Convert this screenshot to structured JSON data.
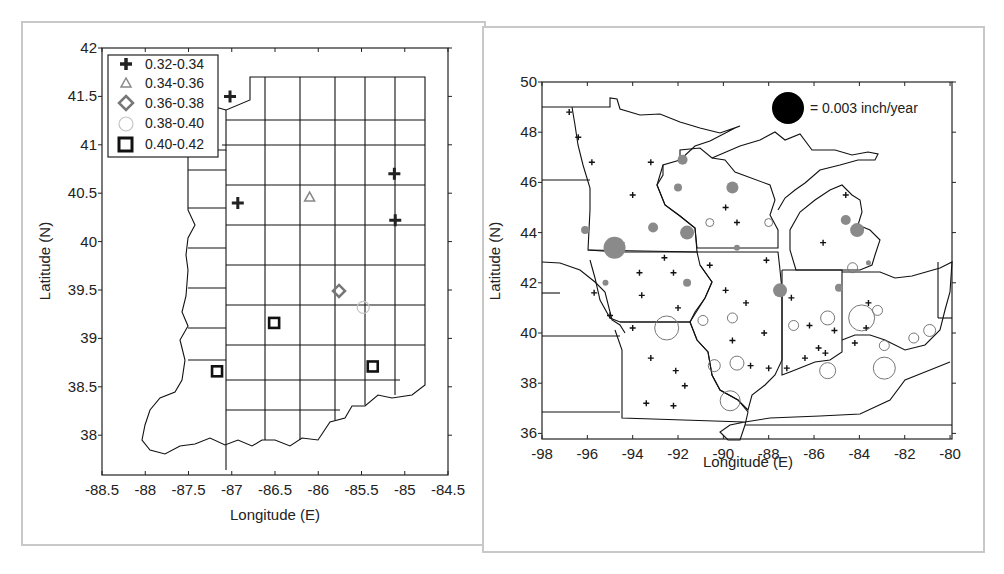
{
  "chart_data": [
    {
      "type": "scatter",
      "title": "",
      "xlabel": "Longitude (E)",
      "ylabel": "Latitude (N)",
      "xlim": [
        -88.5,
        -84.5
      ],
      "ylim": [
        37.6,
        42
      ],
      "xticks": [
        "-88.5",
        "-88",
        "-87.5",
        "-87",
        "-86.5",
        "-86",
        "-85.5",
        "-85",
        "-84.5"
      ],
      "yticks": [
        "42",
        "41.5",
        "41",
        "40.5",
        "40",
        "39.5",
        "39",
        "38.5",
        "38"
      ],
      "grid": false,
      "legend_position": "upper-left",
      "legend": [
        {
          "label": "0.32-0.34",
          "symbol": "plus",
          "color": "#222222"
        },
        {
          "label": "0.34-0.36",
          "symbol": "triangle",
          "color": "#888888"
        },
        {
          "label": "0.36-0.38",
          "symbol": "diamond",
          "color": "#777777"
        },
        {
          "label": "0.38-0.40",
          "symbol": "circle",
          "color": "#bbbbbb"
        },
        {
          "label": "0.40-0.42",
          "symbol": "square",
          "color": "#111111"
        }
      ],
      "points": [
        {
          "lon": -87.02,
          "lat": 41.5,
          "class": "0.32-0.34"
        },
        {
          "lon": -86.93,
          "lat": 40.4,
          "class": "0.32-0.34"
        },
        {
          "lon": -85.12,
          "lat": 40.7,
          "class": "0.32-0.34"
        },
        {
          "lon": -85.11,
          "lat": 40.22,
          "class": "0.32-0.34"
        },
        {
          "lon": -86.1,
          "lat": 40.46,
          "class": "0.34-0.36"
        },
        {
          "lon": -85.76,
          "lat": 39.49,
          "class": "0.36-0.38"
        },
        {
          "lon": -85.48,
          "lat": 39.32,
          "class": "0.38-0.40"
        },
        {
          "lon": -86.51,
          "lat": 39.16,
          "class": "0.40-0.42"
        },
        {
          "lon": -87.17,
          "lat": 38.66,
          "class": "0.40-0.42"
        },
        {
          "lon": -85.37,
          "lat": 38.71,
          "class": "0.40-0.42"
        }
      ]
    },
    {
      "type": "scatter",
      "title": "",
      "xlabel": "Longitude (E)",
      "ylabel": "Latitude (N)",
      "xlim": [
        -98,
        -80
      ],
      "ylim": [
        35.7,
        50
      ],
      "xticks": [
        "-98",
        "-96",
        "-94",
        "-92",
        "-90",
        "-88",
        "-86",
        "-84",
        "-82",
        "-80"
      ],
      "yticks": [
        "50",
        "48",
        "46",
        "44",
        "42",
        "40",
        "38",
        "36"
      ],
      "grid": false,
      "legend": [
        {
          "label": "= 0.003 inch/year",
          "symbol": "filled-circle",
          "color": "#000000"
        }
      ],
      "size_reference": {
        "value": 0.003,
        "unit": "inch/year",
        "radius_px": 16
      },
      "colors": {
        "positive": "#8a8a8a",
        "negative": "#7a7a7a",
        "small": "#111111"
      },
      "points": [
        {
          "lon": -96.8,
          "lat": 48.8,
          "kind": "plus"
        },
        {
          "lon": -96.4,
          "lat": 47.8,
          "kind": "plus"
        },
        {
          "lon": -95.8,
          "lat": 46.8,
          "kind": "plus"
        },
        {
          "lon": -93.2,
          "lat": 46.8,
          "kind": "plus"
        },
        {
          "lon": -94.0,
          "lat": 45.5,
          "kind": "plus"
        },
        {
          "lon": -89.9,
          "lat": 45.0,
          "kind": "plus"
        },
        {
          "lon": -89.4,
          "lat": 44.4,
          "kind": "plus"
        },
        {
          "lon": -94.5,
          "lat": 43.6,
          "kind": "plus"
        },
        {
          "lon": -92.6,
          "lat": 43.0,
          "kind": "plus"
        },
        {
          "lon": -90.6,
          "lat": 42.7,
          "kind": "plus"
        },
        {
          "lon": -88.1,
          "lat": 42.9,
          "kind": "plus"
        },
        {
          "lon": -93.7,
          "lat": 42.4,
          "kind": "plus"
        },
        {
          "lon": -92.2,
          "lat": 42.4,
          "kind": "plus"
        },
        {
          "lon": -95.7,
          "lat": 41.6,
          "kind": "plus"
        },
        {
          "lon": -93.6,
          "lat": 41.5,
          "kind": "plus"
        },
        {
          "lon": -92.0,
          "lat": 41.0,
          "kind": "plus"
        },
        {
          "lon": -89.9,
          "lat": 41.7,
          "kind": "plus"
        },
        {
          "lon": -89.0,
          "lat": 41.2,
          "kind": "plus"
        },
        {
          "lon": -95.0,
          "lat": 40.7,
          "kind": "plus"
        },
        {
          "lon": -94.0,
          "lat": 40.2,
          "kind": "plus"
        },
        {
          "lon": -89.6,
          "lat": 39.7,
          "kind": "plus"
        },
        {
          "lon": -88.2,
          "lat": 40.0,
          "kind": "plus"
        },
        {
          "lon": -93.2,
          "lat": 39.0,
          "kind": "plus"
        },
        {
          "lon": -92.1,
          "lat": 38.5,
          "kind": "plus"
        },
        {
          "lon": -91.7,
          "lat": 37.9,
          "kind": "plus"
        },
        {
          "lon": -93.4,
          "lat": 37.2,
          "kind": "plus"
        },
        {
          "lon": -92.2,
          "lat": 37.1,
          "kind": "plus"
        },
        {
          "lon": -88.8,
          "lat": 38.7,
          "kind": "plus"
        },
        {
          "lon": -88.0,
          "lat": 38.6,
          "kind": "plus"
        },
        {
          "lon": -87.0,
          "lat": 41.4,
          "kind": "plus"
        },
        {
          "lon": -86.2,
          "lat": 40.3,
          "kind": "plus"
        },
        {
          "lon": -85.8,
          "lat": 39.4,
          "kind": "plus"
        },
        {
          "lon": -85.5,
          "lat": 39.2,
          "kind": "plus"
        },
        {
          "lon": -86.4,
          "lat": 39.0,
          "kind": "plus"
        },
        {
          "lon": -87.2,
          "lat": 38.6,
          "kind": "plus"
        },
        {
          "lon": -85.1,
          "lat": 40.1,
          "kind": "plus"
        },
        {
          "lon": -83.6,
          "lat": 41.2,
          "kind": "plus"
        },
        {
          "lon": -83.7,
          "lat": 40.2,
          "kind": "plus"
        },
        {
          "lon": -84.2,
          "lat": 39.6,
          "kind": "plus"
        },
        {
          "lon": -85.6,
          "lat": 43.6,
          "kind": "plus"
        },
        {
          "lon": -84.6,
          "lat": 45.5,
          "kind": "plus"
        },
        {
          "lon": -91.8,
          "lat": 46.9,
          "kind": "filled",
          "r": 5
        },
        {
          "lon": -92.0,
          "lat": 45.8,
          "kind": "filled",
          "r": 4
        },
        {
          "lon": -89.6,
          "lat": 45.8,
          "kind": "filled",
          "r": 6
        },
        {
          "lon": -96.1,
          "lat": 44.1,
          "kind": "filled",
          "r": 4
        },
        {
          "lon": -93.1,
          "lat": 44.2,
          "kind": "filled",
          "r": 5
        },
        {
          "lon": -91.6,
          "lat": 44.0,
          "kind": "filled",
          "r": 7
        },
        {
          "lon": -94.8,
          "lat": 43.4,
          "kind": "filled",
          "r": 11
        },
        {
          "lon": -89.4,
          "lat": 43.4,
          "kind": "filled",
          "r": 3
        },
        {
          "lon": -95.2,
          "lat": 42.0,
          "kind": "filled",
          "r": 3
        },
        {
          "lon": -91.6,
          "lat": 42.0,
          "kind": "filled",
          "r": 4
        },
        {
          "lon": -87.5,
          "lat": 41.7,
          "kind": "filled",
          "r": 7
        },
        {
          "lon": -84.6,
          "lat": 44.5,
          "kind": "filled",
          "r": 5
        },
        {
          "lon": -84.1,
          "lat": 44.1,
          "kind": "filled",
          "r": 7
        },
        {
          "lon": -83.6,
          "lat": 42.8,
          "kind": "filled",
          "r": 2.5
        },
        {
          "lon": -84.9,
          "lat": 41.8,
          "kind": "filled",
          "r": 4
        },
        {
          "lon": -90.6,
          "lat": 44.4,
          "kind": "hollow",
          "r": 4
        },
        {
          "lon": -88.0,
          "lat": 44.4,
          "kind": "hollow",
          "r": 4
        },
        {
          "lon": -84.3,
          "lat": 42.6,
          "kind": "hollow",
          "r": 5
        },
        {
          "lon": -92.5,
          "lat": 40.2,
          "kind": "hollow",
          "r": 12
        },
        {
          "lon": -90.9,
          "lat": 40.5,
          "kind": "hollow",
          "r": 5
        },
        {
          "lon": -89.6,
          "lat": 40.6,
          "kind": "hollow",
          "r": 5
        },
        {
          "lon": -90.4,
          "lat": 38.7,
          "kind": "hollow",
          "r": 6
        },
        {
          "lon": -89.4,
          "lat": 38.8,
          "kind": "hollow",
          "r": 7
        },
        {
          "lon": -89.7,
          "lat": 37.3,
          "kind": "hollow",
          "r": 10
        },
        {
          "lon": -86.9,
          "lat": 40.3,
          "kind": "hollow",
          "r": 5
        },
        {
          "lon": -85.4,
          "lat": 40.6,
          "kind": "hollow",
          "r": 7
        },
        {
          "lon": -85.4,
          "lat": 38.5,
          "kind": "hollow",
          "r": 8
        },
        {
          "lon": -83.9,
          "lat": 40.6,
          "kind": "hollow",
          "r": 13
        },
        {
          "lon": -83.2,
          "lat": 40.9,
          "kind": "hollow",
          "r": 5
        },
        {
          "lon": -82.9,
          "lat": 39.5,
          "kind": "hollow",
          "r": 5
        },
        {
          "lon": -82.9,
          "lat": 38.6,
          "kind": "hollow",
          "r": 11
        },
        {
          "lon": -81.6,
          "lat": 39.8,
          "kind": "hollow",
          "r": 5
        },
        {
          "lon": -80.9,
          "lat": 40.1,
          "kind": "hollow",
          "r": 6
        }
      ]
    }
  ],
  "left_panel": {
    "xlabel": "Longitude (E)",
    "ylabel": "Latitude (N)",
    "xticks": [
      "-88.5",
      "-88",
      "-87.5",
      "-87",
      "-86.5",
      "-86",
      "-85.5",
      "-85",
      "-84.5"
    ],
    "yticks": [
      "42",
      "41.5",
      "41",
      "40.5",
      "40",
      "39.5",
      "39",
      "38.5",
      "38"
    ],
    "legend": [
      "0.32-0.34",
      "0.34-0.36",
      "0.36-0.38",
      "0.38-0.40",
      "0.40-0.42"
    ]
  },
  "right_panel": {
    "xlabel": "Longitude (E)",
    "ylabel": "Latitude (N)",
    "xticks": [
      "-98",
      "-96",
      "-94",
      "-92",
      "-90",
      "-88",
      "-86",
      "-84",
      "-82",
      "-80"
    ],
    "yticks": [
      "50",
      "48",
      "46",
      "44",
      "42",
      "40",
      "38",
      "36"
    ],
    "size_legend": "= 0.003 inch/year"
  }
}
